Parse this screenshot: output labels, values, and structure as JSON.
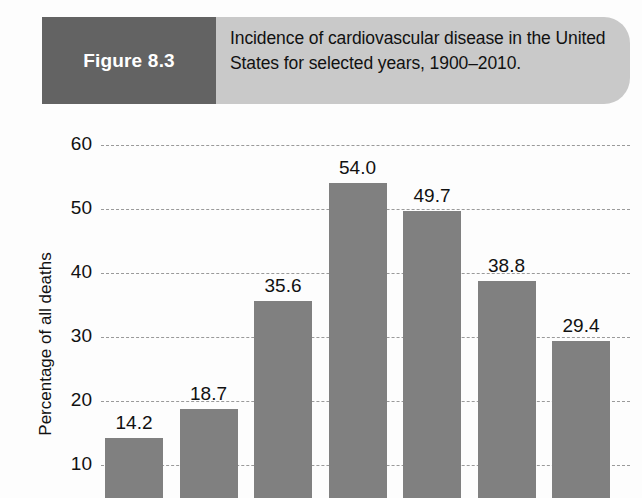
{
  "figure": {
    "number_label": "Figure 8.3",
    "caption": "Incidence of cardiovascular disease in the United States for selected years, 1900–2010.",
    "box_color": "#636363",
    "banner_color": "#c9c9c9"
  },
  "chart_data": {
    "type": "bar",
    "title": "Incidence of cardiovascular disease in the United States for selected years, 1900–2010.",
    "xlabel": "",
    "ylabel": "Percentage of all deaths",
    "ylim": [
      0,
      60
    ],
    "yticks": [
      60,
      50,
      40,
      30,
      20,
      10
    ],
    "ytick_labels": [
      "60",
      "50",
      "40",
      "30",
      "20",
      "10"
    ],
    "grid": "horizontal-dashed",
    "legend": "none",
    "bar_color": "#808080",
    "categories": [
      "",
      "",
      "",
      "",
      "",
      "",
      ""
    ],
    "values": [
      14.2,
      18.7,
      35.6,
      54.0,
      49.7,
      38.8,
      29.4
    ],
    "data_labels": [
      "14.2",
      "18.7",
      "35.6",
      "54.0",
      "49.7",
      "38.8",
      "29.4"
    ],
    "note": "x-axis category labels are cropped below the bottom edge of the image"
  }
}
